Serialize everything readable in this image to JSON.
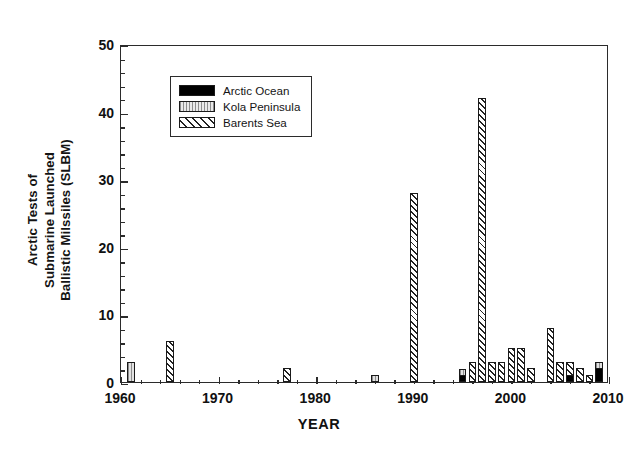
{
  "chart_data": {
    "type": "bar",
    "title": "",
    "subtitle": "",
    "xlabel": "YEAR",
    "ylabel": "Arctic Tests of Submarine Launched Ballistic Milssiles (SLBM)",
    "ylabel_lines": [
      "Arctic Tests of",
      "Submarine Launched",
      "Ballistic Milssiles (SLBM)"
    ],
    "stacked": true,
    "grid": false,
    "legend_position": "upper-left-inside",
    "xlim": [
      1960,
      2010
    ],
    "ylim": [
      0,
      50
    ],
    "xticks": [
      1960,
      1970,
      1980,
      1990,
      2000,
      2010
    ],
    "xtick_labels": [
      "1960",
      "1970",
      "1980",
      "1990",
      "2000",
      "2010"
    ],
    "x_minor_tick_interval": 2,
    "yticks": [
      0,
      10,
      20,
      30,
      40,
      50
    ],
    "ytick_labels": [
      "0",
      "10",
      "20",
      "30",
      "40",
      "50"
    ],
    "y_minor_tick_interval": 2,
    "categories": [
      1961,
      1965,
      1977,
      1986,
      1990,
      1995,
      1996,
      1997,
      1998,
      1999,
      2000,
      2001,
      2002,
      2004,
      2005,
      2006,
      2007,
      2008,
      2009
    ],
    "series": [
      {
        "name": "Arctic Ocean",
        "color": "#000000",
        "pattern": "solid",
        "values": [
          0,
          0,
          0,
          0,
          0,
          1,
          0,
          0,
          0,
          0,
          0,
          0,
          0,
          0,
          0,
          1,
          0,
          0,
          2
        ]
      },
      {
        "name": "Kola Peninsula",
        "color": "#e2e2e2",
        "pattern": "vertical-lines",
        "values": [
          3,
          0,
          0,
          1,
          0,
          1,
          0,
          0,
          0,
          0,
          0,
          0,
          0,
          0,
          0,
          0,
          0,
          0,
          1
        ]
      },
      {
        "name": "Barents Sea",
        "color": "#ffffff",
        "pattern": "diagonal-hatch",
        "values": [
          0,
          6,
          2,
          0,
          28,
          0,
          3,
          42,
          3,
          3,
          5,
          5,
          2,
          8,
          3,
          2,
          2,
          1,
          0
        ]
      }
    ],
    "totals": [
      3,
      6,
      2,
      1,
      28,
      2,
      3,
      42,
      3,
      3,
      5,
      5,
      2,
      8,
      3,
      3,
      2,
      1,
      3
    ]
  },
  "legend": {
    "items": [
      {
        "label": "Arctic Ocean",
        "swatch": "solid-black"
      },
      {
        "label": "Kola Peninsula",
        "swatch": "vertical-lines"
      },
      {
        "label": "Barents Sea",
        "swatch": "diagonal-hatch"
      }
    ]
  },
  "colors": {
    "axis": "#2b2b2b",
    "text": "#111111",
    "background": "#ffffff"
  }
}
